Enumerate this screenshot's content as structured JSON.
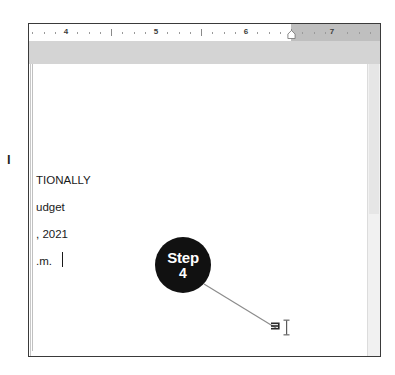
{
  "window": {
    "name": "word-processor-document-window"
  },
  "ruler": {
    "unit_numbers": [
      {
        "label": "4",
        "x": 37
      },
      {
        "label": "5",
        "x": 127
      },
      {
        "label": "6",
        "x": 217
      },
      {
        "label": "7",
        "x": 303
      }
    ],
    "right_indent_marker": "right-indent-marker",
    "margin_zone_color": "#bfbfbf",
    "background_color": "#ffffff"
  },
  "document": {
    "lines": [
      "TIONALLY",
      "udget",
      ", 2021",
      ".m."
    ],
    "caret_visible": true,
    "clipped_left_glyph": "l",
    "page_background": "#ffffff",
    "text_color": "#1a1a1a"
  },
  "callout": {
    "label": "Step",
    "number": "4",
    "badge_color": "#111111",
    "badge_text_color": "#ffffff",
    "leader_line_color": "#8c8c8c"
  },
  "pointer": {
    "paragraph_mark_icon": "paragraph-end-mark",
    "cursor_icon": "i-beam-cursor"
  },
  "scrollbar": {
    "track_color": "#f1f1f1",
    "thumb_color": "#e6e6e6"
  }
}
